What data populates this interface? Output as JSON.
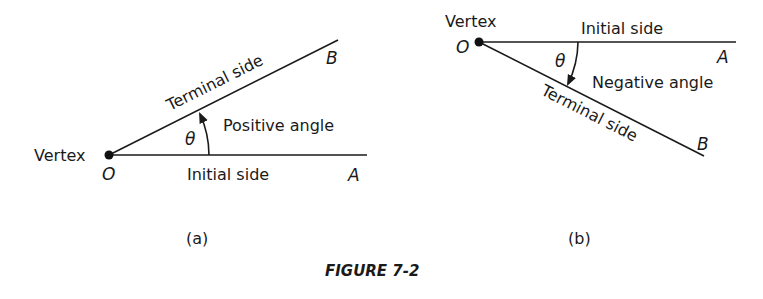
{
  "figure": {
    "caption": "FIGURE 7-2",
    "panel_a": {
      "label": "(a)",
      "vertex_label": "Vertex",
      "vertex_point": "O",
      "initial_side_label": "Initial side",
      "initial_point": "A",
      "terminal_side_label": "Terminal side",
      "terminal_point": "B",
      "angle_symbol": "θ",
      "angle_label": "Positive angle"
    },
    "panel_b": {
      "label": "(b)",
      "vertex_label": "Vertex",
      "vertex_point": "O",
      "initial_side_label": "Initial side",
      "initial_point": "A",
      "terminal_side_label": "Terminal side",
      "terminal_point": "B",
      "angle_symbol": "θ",
      "angle_label": "Negative angle"
    }
  }
}
